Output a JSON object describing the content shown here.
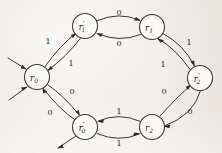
{
  "diagram": {
    "type": "directed-graph",
    "background_color": "#f3f1ec",
    "ink_color": "#3a3733",
    "nodes": [
      {
        "id": "r0",
        "base": "r",
        "subscript": "0",
        "prime": "",
        "label": "r0",
        "cx": 37,
        "cy": 77,
        "r": 12.5
      },
      {
        "id": "r1p",
        "base": "r",
        "subscript": "1",
        "prime": "′",
        "label": "r1'",
        "cx": 85,
        "cy": 26,
        "r": 12.5
      },
      {
        "id": "r1",
        "base": "r",
        "subscript": "1",
        "prime": "",
        "label": "r1",
        "cx": 152,
        "cy": 27,
        "r": 12.5
      },
      {
        "id": "r2p",
        "base": "r",
        "subscript": "2",
        "prime": "′",
        "label": "r2'",
        "cx": 200,
        "cy": 78,
        "r": 12.5
      },
      {
        "id": "r2",
        "base": "r",
        "subscript": "2",
        "prime": "",
        "label": "r2",
        "cx": 152,
        "cy": 127,
        "r": 12.5
      },
      {
        "id": "r0p",
        "base": "r",
        "subscript": "0",
        "prime": "′",
        "label": "r0'",
        "cx": 85,
        "cy": 127,
        "r": 12.5
      }
    ],
    "edges": [
      {
        "id": "e-r0-r1p",
        "from": "r0",
        "to": "r1p",
        "label": "1",
        "label_x": 48,
        "label_y": 42
      },
      {
        "id": "e-r1p-r0",
        "from": "r1p",
        "to": "r0",
        "label": "1",
        "label_x": 71,
        "label_y": 64
      },
      {
        "id": "e-r1p-r1",
        "from": "r1p",
        "to": "r1",
        "label": "0",
        "label_x": 119,
        "label_y": 13
      },
      {
        "id": "e-r1-r1p",
        "from": "r1",
        "to": "r1p",
        "label": "0",
        "label_x": 119,
        "label_y": 44
      },
      {
        "id": "e-r1-r2p",
        "from": "r1",
        "to": "r2p",
        "label": "1",
        "label_x": 189,
        "label_y": 43
      },
      {
        "id": "e-r2p-r1",
        "from": "r2p",
        "to": "r1",
        "label": "1",
        "label_x": 163,
        "label_y": 65
      },
      {
        "id": "e-r2p-r2",
        "from": "r2p",
        "to": "r2",
        "label": "0",
        "label_x": 190,
        "label_y": 112
      },
      {
        "id": "e-r2-r2p",
        "from": "r2",
        "to": "r2p",
        "label": "0",
        "label_x": 164,
        "label_y": 92
      },
      {
        "id": "e-r2-r0p",
        "from": "r2",
        "to": "r0p",
        "label": "1",
        "label_x": 119,
        "label_y": 112
      },
      {
        "id": "e-r0p-r2",
        "from": "r0p",
        "to": "r2",
        "label": "1",
        "label_x": 119,
        "label_y": 144
      },
      {
        "id": "e-r0p-r0",
        "from": "r0p",
        "to": "r0",
        "label": "0",
        "label_x": 50,
        "label_y": 113
      },
      {
        "id": "e-r0-r0p",
        "from": "r0",
        "to": "r0p",
        "label": "0",
        "label_x": 72,
        "label_y": 92
      }
    ],
    "external_arrows": [
      {
        "id": "in-r0-upper",
        "node": "r0",
        "direction": "incoming",
        "side": "upper-left"
      },
      {
        "id": "in-r0-lower",
        "node": "r0",
        "direction": "incoming",
        "side": "lower-left"
      },
      {
        "id": "out-r0p-lower",
        "node": "r0p",
        "direction": "outgoing",
        "side": "lower-left"
      }
    ]
  }
}
